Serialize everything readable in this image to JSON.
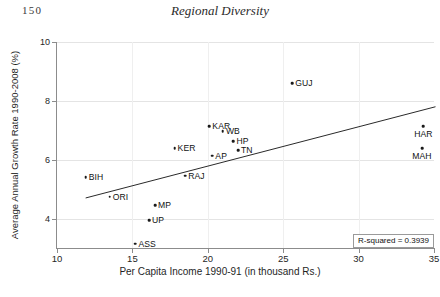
{
  "page": {
    "folio": "150",
    "running_head": "Regional Diversity"
  },
  "chart_data": {
    "type": "scatter",
    "title": "",
    "xlabel": "Per Capita Income 1990-91 (in thousand Rs.)",
    "ylabel": "Average Annual Growth Rate 1990-2008 (%)",
    "xlim": [
      10,
      35
    ],
    "ylim": [
      3,
      10
    ],
    "xticks": [
      10,
      15,
      20,
      25,
      30,
      35
    ],
    "yticks": [
      4,
      6,
      8,
      10
    ],
    "grid": true,
    "legend": "none",
    "annotation": "R-squared = 0.3939",
    "r_squared": 0.3939,
    "trendline": {
      "type": "linear",
      "x_start": 11.9,
      "y_start": 4.7,
      "x_end": 35.1,
      "y_end": 7.8
    },
    "points": [
      {
        "label": "GUJ",
        "x": 25.6,
        "y": 8.6,
        "label_pos": "right"
      },
      {
        "label": "KAR",
        "x": 20.1,
        "y": 7.13,
        "label_pos": "right"
      },
      {
        "label": "WB",
        "x": 21.0,
        "y": 6.96,
        "label_pos": "right"
      },
      {
        "label": "HP",
        "x": 21.7,
        "y": 6.62,
        "label_pos": "right"
      },
      {
        "label": "TN",
        "x": 22.0,
        "y": 6.32,
        "label_pos": "right"
      },
      {
        "label": "KER",
        "x": 17.8,
        "y": 6.4,
        "label_pos": "right"
      },
      {
        "label": "AP",
        "x": 20.3,
        "y": 6.13,
        "label_pos": "right"
      },
      {
        "label": "HAR",
        "x": 34.3,
        "y": 7.13,
        "label_pos": "below"
      },
      {
        "label": "MAH",
        "x": 34.2,
        "y": 6.4,
        "label_pos": "below"
      },
      {
        "label": "RAJ",
        "x": 18.5,
        "y": 5.45,
        "label_pos": "right"
      },
      {
        "label": "BIH",
        "x": 11.9,
        "y": 5.4,
        "label_pos": "right"
      },
      {
        "label": "ORI",
        "x": 13.5,
        "y": 4.75,
        "label_pos": "right"
      },
      {
        "label": "MP",
        "x": 16.5,
        "y": 4.45,
        "label_pos": "right"
      },
      {
        "label": "UP",
        "x": 16.1,
        "y": 3.95,
        "label_pos": "right"
      },
      {
        "label": "ASS",
        "x": 15.2,
        "y": 3.15,
        "label_pos": "right"
      }
    ]
  }
}
